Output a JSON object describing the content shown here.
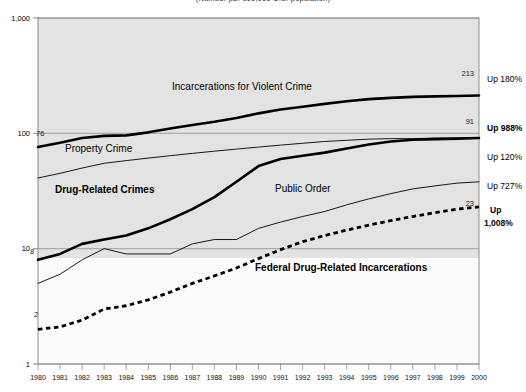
{
  "chart_data": {
    "type": "line",
    "title": "(Number per 100,000 U.S. population)",
    "xlabel": "",
    "ylabel": "",
    "yscale": "log",
    "ylim": [
      1,
      1000
    ],
    "ytick_labels": [
      "1,000",
      "100",
      "10",
      "1"
    ],
    "ytick_values": [
      1000,
      100,
      10,
      1
    ],
    "grid": true,
    "legend_position": "inline-annotations",
    "x": [
      1980,
      1981,
      1982,
      1983,
      1984,
      1985,
      1986,
      1987,
      1988,
      1989,
      1990,
      1991,
      1992,
      1993,
      1994,
      1995,
      1996,
      1997,
      1998,
      1999,
      2000
    ],
    "categories": [
      "1980",
      "1981",
      "1982",
      "1983",
      "1984",
      "1985",
      "1986",
      "1987",
      "1988",
      "1989",
      "1990",
      "1991",
      "1992",
      "1993",
      "1994",
      "1995",
      "1996",
      "1997",
      "1998",
      "1999",
      "2000"
    ],
    "series": [
      {
        "name": "Incarcerations for Violent Crime",
        "style": "thick-solid",
        "start_value": 76,
        "end_value": 213,
        "growth_label": "Up 180%",
        "values": [
          76,
          83,
          91,
          95,
          96,
          102,
          110,
          118,
          126,
          136,
          149,
          161,
          170,
          180,
          190,
          198,
          203,
          207,
          209,
          211,
          213
        ]
      },
      {
        "name": "Property Crime",
        "style": "thin-solid",
        "end_value": 91,
        "growth_label": "Up 120%",
        "values": [
          41,
          45,
          50,
          55,
          58,
          61,
          64,
          67,
          70,
          73,
          76,
          79,
          82,
          85,
          87,
          89,
          90,
          90,
          91,
          91,
          91
        ]
      },
      {
        "name": "Drug-Related Crimes",
        "style": "thick-solid",
        "start_value": 8,
        "end_value": 91,
        "growth_label": "Up 988%",
        "values": [
          8,
          9,
          11,
          12,
          13,
          15,
          18,
          22,
          28,
          38,
          52,
          60,
          64,
          68,
          74,
          80,
          85,
          88,
          89,
          90,
          91
        ]
      },
      {
        "name": "Public Order",
        "style": "thin-solid",
        "end_value": 38,
        "growth_label": "Up 727%",
        "values": [
          5,
          6,
          8,
          10,
          9,
          9,
          9,
          11,
          12,
          12,
          15,
          17,
          19,
          21,
          24,
          27,
          30,
          33,
          35,
          37,
          38
        ]
      },
      {
        "name": "Federal Drug-Related Incarcerations",
        "style": "thick-dotted",
        "start_value": 2,
        "end_value": 23,
        "growth_label": "Up 1,008%",
        "values": [
          2,
          2.1,
          2.4,
          3.0,
          3.2,
          3.6,
          4.2,
          5.0,
          5.8,
          6.8,
          8.2,
          9.8,
          11.5,
          13.0,
          14.5,
          16.0,
          17.5,
          19.0,
          20.5,
          22.0,
          23
        ]
      }
    ],
    "annotations": [
      {
        "text": "Incarcerations for Violent Crime",
        "bold": false
      },
      {
        "text": "Property Crime",
        "bold": false
      },
      {
        "text": "Drug-Related Crimes",
        "bold": true
      },
      {
        "text": "Public Order",
        "bold": false
      },
      {
        "text": "Federal Drug-Related Incarcerations",
        "bold": true
      }
    ],
    "right_labels": [
      {
        "text": "Up 180%",
        "bold": false
      },
      {
        "text": "Up 988%",
        "bold": true
      },
      {
        "text": "Up 120%",
        "bold": false
      },
      {
        "text": "Up 727%",
        "bold": false
      },
      {
        "text": "Up",
        "bold": true
      },
      {
        "text": "1,008%",
        "bold": true
      }
    ],
    "point_labels": {
      "violent_start": "76",
      "violent_end": "213",
      "property_end": "91",
      "drug_start": "8",
      "federal_start": "2",
      "federal_end": "23"
    },
    "colors": {
      "plot_background": "#e3e3e3",
      "line": "#000000",
      "grid": "#9a9a9a",
      "frame": "#8d8d8d",
      "page_background": "#ffffff"
    }
  }
}
